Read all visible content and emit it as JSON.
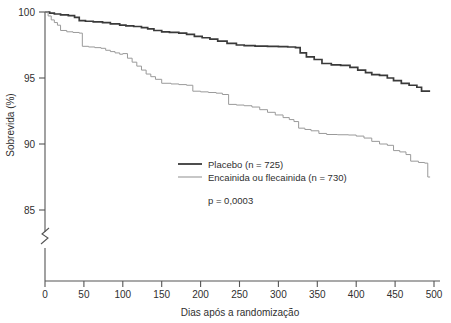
{
  "chart_data": {
    "type": "line",
    "subtype": "kaplan-meier-step",
    "title": "",
    "subtitle": "",
    "xlabel": "Dias após a randomização",
    "ylabel": "Sobrevida (%)",
    "xlim": [
      0,
      500
    ],
    "ylim": [
      85,
      100
    ],
    "y_axis_break": true,
    "y_axis_break_note": "zigzag break below 85",
    "grid": false,
    "legend_position": "center",
    "xticks": [
      0,
      50,
      100,
      150,
      200,
      250,
      300,
      350,
      400,
      450,
      500
    ],
    "xtick_labels": [
      "0",
      "50",
      "100",
      "150",
      "200",
      "250",
      "300",
      "350",
      "400",
      "450",
      "500"
    ],
    "yticks": [
      85,
      90,
      95,
      100
    ],
    "ytick_labels": [
      "85",
      "90",
      "95",
      "100"
    ],
    "annotations": [
      {
        "name": "p-value",
        "text": "p = 0,0003"
      }
    ],
    "series": [
      {
        "name": "Placebo (n = 725)",
        "label": "Placebo",
        "n": 725,
        "color": "#3a3a3a",
        "linewidth": 1.7,
        "points": [
          [
            0,
            100.0
          ],
          [
            6,
            99.92
          ],
          [
            12,
            99.85
          ],
          [
            20,
            99.78
          ],
          [
            30,
            99.72
          ],
          [
            38,
            99.6
          ],
          [
            44,
            99.35
          ],
          [
            52,
            99.3
          ],
          [
            62,
            99.25
          ],
          [
            74,
            99.2
          ],
          [
            84,
            99.1
          ],
          [
            96,
            99.0
          ],
          [
            104,
            98.95
          ],
          [
            114,
            98.9
          ],
          [
            124,
            98.82
          ],
          [
            132,
            98.72
          ],
          [
            140,
            98.6
          ],
          [
            150,
            98.5
          ],
          [
            160,
            98.45
          ],
          [
            172,
            98.4
          ],
          [
            182,
            98.3
          ],
          [
            192,
            98.15
          ],
          [
            202,
            98.05
          ],
          [
            212,
            97.95
          ],
          [
            222,
            97.8
          ],
          [
            234,
            97.62
          ],
          [
            246,
            97.5
          ],
          [
            256,
            97.45
          ],
          [
            270,
            97.42
          ],
          [
            286,
            97.4
          ],
          [
            300,
            97.38
          ],
          [
            312,
            97.35
          ],
          [
            322,
            97.3
          ],
          [
            328,
            96.9
          ],
          [
            336,
            96.6
          ],
          [
            346,
            96.4
          ],
          [
            356,
            96.1
          ],
          [
            368,
            96.0
          ],
          [
            380,
            95.95
          ],
          [
            392,
            95.8
          ],
          [
            402,
            95.6
          ],
          [
            412,
            95.4
          ],
          [
            420,
            95.25
          ],
          [
            430,
            95.2
          ],
          [
            440,
            95.0
          ],
          [
            448,
            94.8
          ],
          [
            458,
            94.6
          ],
          [
            468,
            94.45
          ],
          [
            478,
            94.3
          ],
          [
            484,
            94.0
          ],
          [
            495,
            94.0
          ]
        ]
      },
      {
        "name": "Encainida ou flecainida (n = 730)",
        "label": "Encainida ou flecainida",
        "n": 730,
        "color": "#9a9a9a",
        "linewidth": 1.0,
        "points": [
          [
            0,
            100.0
          ],
          [
            4,
            99.7
          ],
          [
            8,
            99.4
          ],
          [
            12,
            99.2
          ],
          [
            16,
            99.0
          ],
          [
            20,
            98.6
          ],
          [
            28,
            98.5
          ],
          [
            36,
            98.45
          ],
          [
            44,
            98.4
          ],
          [
            48,
            97.4
          ],
          [
            56,
            97.35
          ],
          [
            64,
            97.3
          ],
          [
            72,
            97.25
          ],
          [
            78,
            97.1
          ],
          [
            84,
            97.0
          ],
          [
            90,
            96.9
          ],
          [
            96,
            96.8
          ],
          [
            100,
            96.85
          ],
          [
            106,
            96.5
          ],
          [
            112,
            96.2
          ],
          [
            118,
            95.9
          ],
          [
            124,
            95.6
          ],
          [
            130,
            95.3
          ],
          [
            136,
            95.1
          ],
          [
            142,
            94.9
          ],
          [
            150,
            94.6
          ],
          [
            162,
            94.55
          ],
          [
            172,
            94.5
          ],
          [
            182,
            94.45
          ],
          [
            190,
            94.0
          ],
          [
            200,
            93.95
          ],
          [
            210,
            93.9
          ],
          [
            220,
            93.85
          ],
          [
            228,
            93.75
          ],
          [
            236,
            93.0
          ],
          [
            246,
            92.95
          ],
          [
            256,
            92.9
          ],
          [
            266,
            92.8
          ],
          [
            276,
            92.6
          ],
          [
            286,
            92.4
          ],
          [
            296,
            92.2
          ],
          [
            306,
            92.0
          ],
          [
            314,
            91.85
          ],
          [
            320,
            91.7
          ],
          [
            326,
            91.2
          ],
          [
            334,
            91.1
          ],
          [
            342,
            91.0
          ],
          [
            352,
            90.8
          ],
          [
            362,
            90.72
          ],
          [
            376,
            90.7
          ],
          [
            390,
            90.68
          ],
          [
            400,
            90.6
          ],
          [
            410,
            90.45
          ],
          [
            420,
            90.2
          ],
          [
            430,
            90.0
          ],
          [
            440,
            89.9
          ],
          [
            448,
            89.5
          ],
          [
            456,
            89.4
          ],
          [
            464,
            89.2
          ],
          [
            470,
            88.7
          ],
          [
            480,
            88.6
          ],
          [
            488,
            88.55
          ],
          [
            492,
            87.5
          ],
          [
            495,
            87.5
          ]
        ]
      }
    ]
  },
  "axes": {
    "y_label": "Sobrevida (%)",
    "x_label": "Dias após a randomização",
    "y_ticks": [
      "100",
      "95",
      "90",
      "85"
    ],
    "x_ticks": [
      "0",
      "50",
      "100",
      "150",
      "200",
      "250",
      "300",
      "350",
      "400",
      "450",
      "500"
    ]
  },
  "legend": {
    "items": [
      {
        "label": "Placebo (n = 725)",
        "swatch": "placebo-line-swatch"
      },
      {
        "label": "Encainida ou flecainida (n = 730)",
        "swatch": "drug-line-swatch"
      }
    ],
    "pvalue": "p = 0,0003"
  },
  "colors": {
    "placebo": "#3a3a3a",
    "drug": "#9a9a9a",
    "axis": "#555555",
    "text": "#2f2f2f",
    "background": "#ffffff"
  }
}
